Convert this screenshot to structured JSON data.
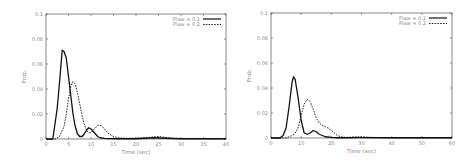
{
  "chart_data": [
    {
      "type": "line",
      "title": "",
      "xlabel": "Time (sec)",
      "ylabel": "Prob.",
      "xlim": [
        0,
        40
      ],
      "ylim": [
        0,
        0.1
      ],
      "xticks": [
        0,
        5,
        10,
        15,
        20,
        25,
        30,
        35,
        40
      ],
      "yticks": [
        0,
        0.02,
        0.04,
        0.06,
        0.08,
        0.1
      ],
      "ytick_labels": [
        "0",
        "0.02",
        "0.04",
        "0.06",
        "0.08",
        "0.1"
      ],
      "grid": false,
      "legend_position": "upper right",
      "series": [
        {
          "name": "Plaw = 0.1",
          "style": "solid",
          "x": [
            0,
            1.5,
            2,
            2.5,
            3,
            3.3,
            3.6,
            4,
            4.5,
            5,
            5.5,
            6,
            6.5,
            7,
            7.5,
            8,
            8.5,
            9,
            9.5,
            10,
            10.5,
            11,
            11.5,
            12,
            13,
            14,
            16,
            20,
            24,
            30,
            40
          ],
          "y": [
            0,
            0,
            0.012,
            0.025,
            0.045,
            0.058,
            0.071,
            0.07,
            0.065,
            0.05,
            0.035,
            0.02,
            0.01,
            0.004,
            0.002,
            0.002,
            0.004,
            0.007,
            0.009,
            0.008,
            0.006,
            0.004,
            0.002,
            0.001,
            0.0005,
            0.0003,
            0.0002,
            0.0002,
            0.001,
            0.0002,
            0.0002
          ]
        },
        {
          "name": "Plaw = 0.2",
          "style": "dashed",
          "x": [
            0,
            2,
            3,
            4,
            4.5,
            5,
            5.5,
            6,
            6.5,
            7,
            7.5,
            8,
            8.5,
            9,
            9.5,
            10,
            10.5,
            11,
            11.5,
            12,
            12.5,
            13,
            14,
            15,
            16,
            18,
            22,
            25,
            28,
            40
          ],
          "y": [
            0,
            0,
            0.002,
            0.01,
            0.02,
            0.032,
            0.042,
            0.046,
            0.044,
            0.037,
            0.028,
            0.019,
            0.012,
            0.007,
            0.005,
            0.005,
            0.007,
            0.009,
            0.011,
            0.011,
            0.01,
            0.008,
            0.004,
            0.002,
            0.001,
            0.0005,
            0.001,
            0.002,
            0.0005,
            0.0003
          ]
        }
      ]
    },
    {
      "type": "line",
      "title": "",
      "xlabel": "Time (sec)",
      "ylabel": "Prob.",
      "xlim": [
        0,
        60
      ],
      "ylim": [
        0,
        0.1
      ],
      "xticks": [
        0,
        10,
        20,
        30,
        40,
        50,
        60
      ],
      "yticks": [
        0,
        0.02,
        0.04,
        0.06,
        0.08,
        0.1
      ],
      "ytick_labels": [
        "0",
        "0.02",
        "0.04",
        "0.06",
        "0.08",
        "0.1"
      ],
      "grid": false,
      "legend_position": "upper right",
      "series": [
        {
          "name": "Plaw = 0.1",
          "style": "solid",
          "x": [
            0,
            3,
            4,
            5,
            6,
            7,
            7.5,
            8,
            9,
            10,
            11,
            12,
            13,
            14,
            15,
            16,
            17,
            18,
            20,
            22,
            25,
            30,
            40,
            60
          ],
          "y": [
            0,
            0,
            0.002,
            0.008,
            0.025,
            0.045,
            0.049,
            0.047,
            0.032,
            0.014,
            0.004,
            0.003,
            0.004,
            0.006,
            0.005,
            0.003,
            0.002,
            0.001,
            0.0005,
            0.0002,
            0.0002,
            0.0003,
            0.0002,
            0.0002
          ]
        },
        {
          "name": "Plaw = 0.2",
          "style": "dashed",
          "x": [
            0,
            5,
            7,
            8,
            9,
            10,
            11,
            12,
            13,
            14,
            15,
            16,
            17,
            18,
            19,
            20,
            21,
            22,
            23,
            25,
            28,
            30,
            33,
            40,
            60
          ],
          "y": [
            0,
            0,
            0.002,
            0.004,
            0.008,
            0.018,
            0.027,
            0.031,
            0.029,
            0.023,
            0.016,
            0.012,
            0.01,
            0.009,
            0.008,
            0.006,
            0.004,
            0.002,
            0.001,
            0.0005,
            0.001,
            0.001,
            0.0005,
            0.0002,
            0.0002
          ]
        }
      ]
    }
  ],
  "charts": [
    {
      "legend": [
        "Plaw = 0.1",
        "Plaw = 0.2"
      ],
      "xlabel": "Time (sec)",
      "ylabel": "Prob."
    },
    {
      "legend": [
        "Plaw = 0.1",
        "Plaw = 0.2"
      ],
      "xlabel": "Time (sec)",
      "ylabel": "Prob."
    }
  ]
}
